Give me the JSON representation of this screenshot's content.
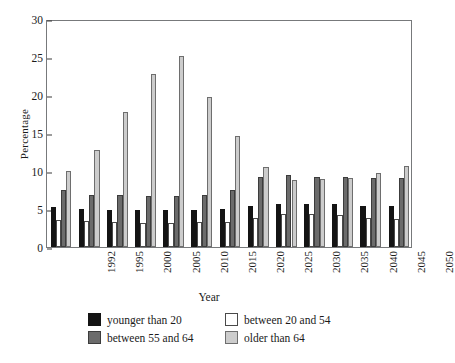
{
  "chart_data": {
    "type": "bar",
    "title": "",
    "xlabel": "Year",
    "ylabel": "Percentage",
    "ylim": [
      0,
      30
    ],
    "yticks": [
      0,
      5,
      10,
      15,
      20,
      25,
      30
    ],
    "grid": false,
    "legend_position": "bottom",
    "categories": [
      "1992",
      "1995",
      "2000",
      "2005",
      "2010",
      "2015",
      "2020",
      "2025",
      "2030",
      "2035",
      "2040",
      "2045",
      "2050"
    ],
    "series": [
      {
        "name": "younger than 20",
        "color": "#141414",
        "values": [
          5.2,
          5.0,
          4.9,
          4.85,
          4.85,
          4.9,
          5.05,
          5.45,
          5.7,
          5.7,
          5.6,
          5.45,
          5.4
        ]
      },
      {
        "name": "between 20 and 54",
        "color": "#ffffff",
        "values": [
          3.6,
          3.4,
          3.3,
          3.2,
          3.2,
          3.3,
          3.3,
          3.8,
          4.3,
          4.3,
          4.2,
          3.8,
          3.7
        ]
      },
      {
        "name": "between 55 and 64",
        "color": "#6b6b6b",
        "values": [
          7.5,
          6.9,
          6.8,
          6.7,
          6.7,
          6.9,
          7.5,
          9.2,
          9.5,
          9.2,
          9.2,
          9.1,
          9.1
        ]
      },
      {
        "name": "older than 64",
        "color": "#cccccc",
        "values": [
          10.0,
          12.8,
          17.8,
          22.8,
          25.1,
          19.7,
          14.6,
          10.5,
          8.8,
          9.0,
          9.1,
          9.8,
          10.6
        ]
      }
    ]
  }
}
